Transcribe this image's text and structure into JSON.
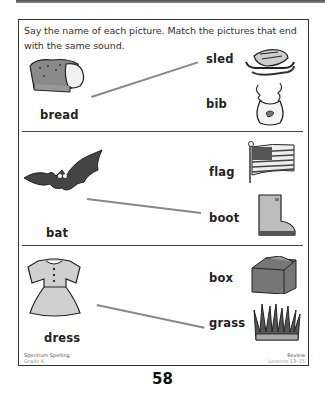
{
  "instructions": "Say the name of each picture. Match the pictures that end with the same sound.",
  "groups": [
    {
      "left": {
        "word": "bread",
        "picture": "bread-loaf"
      },
      "right": [
        {
          "word": "sled",
          "picture": "sled"
        },
        {
          "word": "bib",
          "picture": "bib"
        }
      ],
      "match": "sled"
    },
    {
      "left": {
        "word": "bat",
        "picture": "bat"
      },
      "right": [
        {
          "word": "flag",
          "picture": "flag"
        },
        {
          "word": "boot",
          "picture": "boot"
        }
      ],
      "match": "boot"
    },
    {
      "left": {
        "word": "dress",
        "picture": "dress"
      },
      "right": [
        {
          "word": "box",
          "picture": "box"
        },
        {
          "word": "grass",
          "picture": "grass"
        }
      ],
      "match": "grass"
    }
  ],
  "footer": {
    "left_title": "Spectrum Spelling",
    "left_sub": "Grade K",
    "right_title": "Review",
    "right_sub": "Lessons 13–15"
  },
  "page_number": "58",
  "colors": {
    "match_line": "#888888",
    "frame": "#333333"
  }
}
